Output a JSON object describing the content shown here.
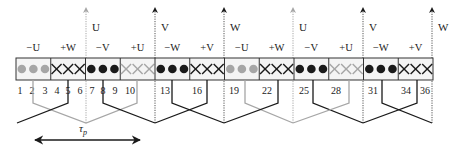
{
  "colors": {
    "black": "#1a1a1a",
    "gray": "#a6a6a6",
    "bar_fill": "#f4f4f4",
    "dotted": "#555555"
  },
  "bar": {
    "x": 16,
    "y": 58,
    "width": 417,
    "height": 22,
    "group_count": 12
  },
  "phase_arrows": [
    {
      "label": "U",
      "x": 86,
      "color": "gray"
    },
    {
      "label": "V",
      "x": 155,
      "color": "black"
    },
    {
      "label": "W",
      "x": 224,
      "color": "black"
    },
    {
      "label": "U",
      "x": 293,
      "color": "gray"
    },
    {
      "label": "V",
      "x": 363,
      "color": "black"
    },
    {
      "label": "W",
      "x": 432,
      "color": "black"
    }
  ],
  "groups": [
    {
      "label": "−U",
      "symbol": "dot",
      "color": "gray"
    },
    {
      "label": "+W",
      "symbol": "cross",
      "color": "black"
    },
    {
      "label": "−V",
      "symbol": "dot",
      "color": "black"
    },
    {
      "label": "+U",
      "symbol": "cross",
      "color": "gray"
    },
    {
      "label": "−W",
      "symbol": "dot",
      "color": "black"
    },
    {
      "label": "+V",
      "symbol": "cross",
      "color": "black"
    },
    {
      "label": "−U",
      "symbol": "dot",
      "color": "gray"
    },
    {
      "label": "+W",
      "symbol": "cross",
      "color": "black"
    },
    {
      "label": "−V",
      "symbol": "dot",
      "color": "black"
    },
    {
      "label": "+U",
      "symbol": "cross",
      "color": "gray"
    },
    {
      "label": "−W",
      "symbol": "dot",
      "color": "black"
    },
    {
      "label": "+V",
      "symbol": "cross",
      "color": "black"
    }
  ],
  "slot_numbers": [
    {
      "n": "1",
      "x": 20
    },
    {
      "n": "2",
      "x": 32
    },
    {
      "n": "3",
      "x": 45
    },
    {
      "n": "4",
      "x": 57
    },
    {
      "n": "5",
      "x": 68
    },
    {
      "n": "6",
      "x": 80
    },
    {
      "n": "7",
      "x": 92
    },
    {
      "n": "8",
      "x": 103
    },
    {
      "n": "9",
      "x": 115
    },
    {
      "n": "10",
      "x": 130
    },
    {
      "n": "13",
      "x": 165
    },
    {
      "n": "16",
      "x": 197
    },
    {
      "n": "19",
      "x": 234
    },
    {
      "n": "22",
      "x": 267
    },
    {
      "n": "25",
      "x": 304
    },
    {
      "n": "28",
      "x": 336
    },
    {
      "n": "31",
      "x": 373
    },
    {
      "n": "34",
      "x": 406
    },
    {
      "n": "36",
      "x": 425
    }
  ],
  "windings": [
    {
      "color": "gray",
      "points": [
        [
          33,
          80
        ],
        [
          33,
          103
        ],
        [
          86,
          123
        ],
        [
          137,
          103
        ],
        [
          137,
          80
        ]
      ]
    },
    {
      "color": "black",
      "points": [
        [
          68,
          80
        ],
        [
          68,
          103
        ],
        [
          17,
          123
        ]
      ]
    },
    {
      "color": "black",
      "points": [
        [
          103,
          80
        ],
        [
          103,
          103
        ],
        [
          155,
          123
        ]
      ]
    },
    {
      "color": "black",
      "points": [
        [
          172,
          80
        ],
        [
          172,
          103
        ],
        [
          224,
          123
        ]
      ]
    },
    {
      "color": "black",
      "points": [
        [
          207,
          80
        ],
        [
          207,
          103
        ],
        [
          155,
          123
        ]
      ]
    },
    {
      "color": "gray",
      "points": [
        [
          245,
          80
        ],
        [
          245,
          103
        ],
        [
          293,
          123
        ]
      ]
    },
    {
      "color": "black",
      "points": [
        [
          278,
          80
        ],
        [
          278,
          103
        ],
        [
          224,
          123
        ]
      ]
    },
    {
      "color": "black",
      "points": [
        [
          313,
          80
        ],
        [
          313,
          103
        ],
        [
          363,
          123
        ]
      ]
    },
    {
      "color": "gray",
      "points": [
        [
          349,
          80
        ],
        [
          349,
          103
        ],
        [
          293,
          123
        ]
      ]
    },
    {
      "color": "black",
      "points": [
        [
          382,
          80
        ],
        [
          382,
          103
        ],
        [
          432,
          123
        ]
      ]
    },
    {
      "color": "black",
      "points": [
        [
          417,
          80
        ],
        [
          417,
          103
        ],
        [
          363,
          123
        ]
      ]
    }
  ],
  "pole_pitch": {
    "label": "τ",
    "subscript": "p",
    "arrow_x1": 35,
    "arrow_x2": 140,
    "arrow_y": 140,
    "label_x": 83,
    "label_y": 132
  }
}
